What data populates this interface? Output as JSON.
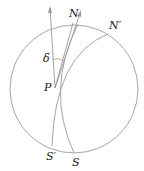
{
  "diagram": {
    "type": "celestial-sphere-projection",
    "labels": {
      "N": "N",
      "N_prime": "N′",
      "P": "P",
      "S": "S",
      "S_prime": "S′",
      "delta": "δ"
    },
    "colors": {
      "stroke": "#9a9a9a",
      "text": "#222222",
      "background": "#ffffff"
    }
  }
}
